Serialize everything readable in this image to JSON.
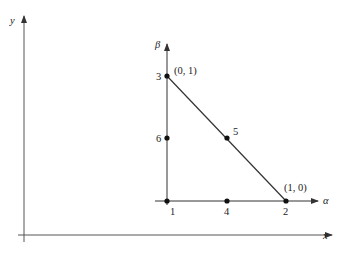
{
  "diagram": {
    "type": "reference triangle mapping",
    "global_axes": {
      "x_label": "x",
      "y_label": "y"
    },
    "local_axes": {
      "alpha_label": "α",
      "beta_label": "β"
    },
    "nodes": [
      {
        "id": "1",
        "label": "1",
        "coord": ""
      },
      {
        "id": "2",
        "label": "2",
        "coord": "(1, 0)"
      },
      {
        "id": "3",
        "label": "3",
        "coord": "(0, 1)"
      },
      {
        "id": "4",
        "label": "4",
        "coord": ""
      },
      {
        "id": "5",
        "label": "5",
        "coord": ""
      },
      {
        "id": "6",
        "label": "6",
        "coord": ""
      }
    ]
  },
  "colors": {
    "line": "#333333",
    "text": "#222222",
    "background": "#ffffff"
  }
}
